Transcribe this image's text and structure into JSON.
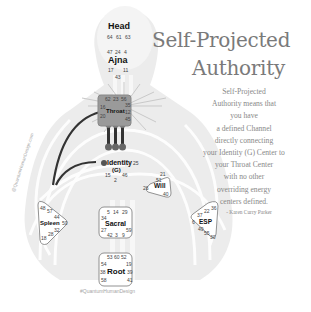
{
  "title": {
    "line1": "Self-Projected",
    "line2": "Authority"
  },
  "quote": {
    "lines": [
      "Self-Projected",
      "Authority means that",
      "you have",
      "a defined Channel",
      "directly connecting",
      "your Identity (G) Center to",
      "your Throat Center",
      "with no other",
      "overriding energy",
      "centers defined."
    ],
    "attribution": "- Karen Curry Parker"
  },
  "watermarks": {
    "side": "@QuantumHumanDesign.com",
    "bottom": "#QuantumHumanDesign"
  },
  "colors": {
    "title": "#7a7a7a",
    "quote": "#888888",
    "defined_center": "#9a9a9a",
    "undefined_center": "#ffffff",
    "body_silhouette": "#ebebeb",
    "channel": "#333333"
  },
  "bodygraph": {
    "centers": {
      "head": {
        "label": "Head",
        "defined": false,
        "gates": [
          "64",
          "61",
          "63"
        ]
      },
      "ajna": {
        "label": "Ajna",
        "defined": false,
        "gates": [
          "47",
          "24",
          "4",
          "17",
          "11",
          "43"
        ]
      },
      "throat": {
        "label": "Throat",
        "defined": true,
        "gates": [
          "62",
          "23",
          "56",
          "16",
          "35",
          "20",
          "12",
          "45",
          "31",
          "8",
          "33"
        ]
      },
      "identity": {
        "label": "Identity",
        "sublabel": "(G)",
        "defined": true,
        "gates": [
          "1",
          "13",
          "7",
          "10",
          "25",
          "15",
          "2",
          "46"
        ]
      },
      "will": {
        "label": "Will",
        "defined": false,
        "gates": [
          "21",
          "51",
          "26",
          "40"
        ]
      },
      "spleen": {
        "label": "Spleen",
        "defined": false,
        "gates": [
          "48",
          "57",
          "44",
          "50",
          "32",
          "28",
          "18"
        ]
      },
      "sacral": {
        "label": "Sacral",
        "defined": false,
        "gates": [
          "5",
          "14",
          "29",
          "34",
          "27",
          "59",
          "42",
          "3",
          "9"
        ]
      },
      "esp": {
        "label": "ESP",
        "defined": false,
        "gates": [
          "36",
          "22",
          "37",
          "6",
          "49",
          "55",
          "30"
        ]
      },
      "root": {
        "label": "Root",
        "defined": false,
        "gates": [
          "53",
          "60",
          "52",
          "54",
          "19",
          "38",
          "39",
          "58",
          "41"
        ]
      }
    },
    "defined_channels": [
      "Identity-Throat"
    ]
  }
}
